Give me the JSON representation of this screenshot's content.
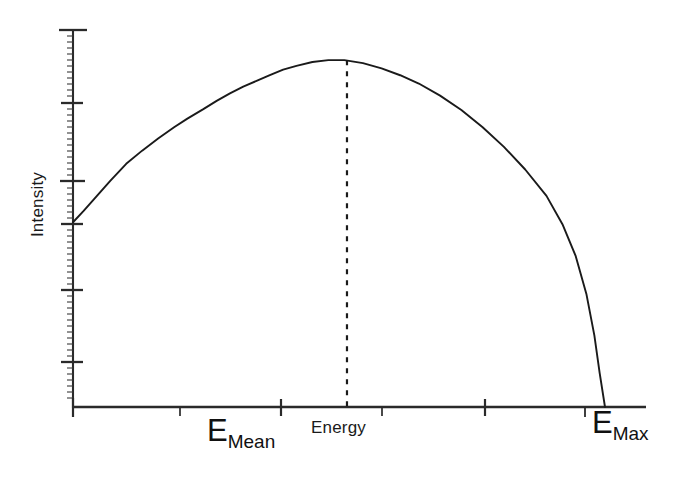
{
  "chart_data": {
    "type": "line",
    "title": "",
    "subtitle": "",
    "xlabel": "Energy",
    "ylabel": "Intensity",
    "grid": false,
    "legend": false,
    "legend_position": "none",
    "xlim": [
      0,
      1
    ],
    "ylim": [
      0,
      1
    ],
    "x_tick_labels": [
      "E_Mean",
      "Energy",
      "E_Max"
    ],
    "y_tick_labels": [],
    "series": [
      {
        "name": "Beta energy spectrum",
        "style": "solid",
        "color": "#1a1a1a",
        "x": [
          0.0,
          0.02,
          0.045,
          0.07,
          0.1,
          0.13,
          0.16,
          0.19,
          0.215,
          0.245,
          0.27,
          0.295,
          0.32,
          0.345,
          0.37,
          0.395,
          0.42,
          0.45,
          0.48,
          0.51,
          0.545,
          0.58,
          0.615,
          0.65,
          0.69,
          0.73,
          0.77,
          0.81,
          0.85,
          0.89,
          0.92,
          0.945,
          0.965,
          0.98,
          0.99,
          1.0
        ],
        "y": [
          0.49,
          0.52,
          0.56,
          0.6,
          0.645,
          0.68,
          0.712,
          0.742,
          0.765,
          0.79,
          0.812,
          0.832,
          0.85,
          0.865,
          0.88,
          0.895,
          0.905,
          0.915,
          0.92,
          0.92,
          0.912,
          0.898,
          0.88,
          0.858,
          0.826,
          0.788,
          0.742,
          0.69,
          0.63,
          0.56,
          0.485,
          0.4,
          0.3,
          0.19,
          0.09,
          0.0
        ]
      }
    ],
    "annotations": [
      {
        "name": "mean-energy-marker",
        "type": "vline",
        "style": "dashed",
        "x": 0.515,
        "y_from": 0.0,
        "y_to": 0.92,
        "label": "E_Mean"
      }
    ]
  },
  "axes": {
    "y_axis": {
      "name": "intensity-axis",
      "label": "Intensity",
      "major_tick_count": 6,
      "minor_ticks": true
    },
    "x_axis": {
      "name": "energy-axis",
      "label": "Energy",
      "major_tick_count": 6,
      "minor_ticks": false
    }
  },
  "labels": {
    "y_axis_title": "Intensity",
    "x_axis_title": "Energy",
    "e_mean": {
      "base": "E",
      "subscript": "Mean"
    },
    "e_max": {
      "base": "E",
      "subscript": "Max"
    }
  },
  "colors": {
    "background": "#ffffff",
    "axis": "#2a2a2a",
    "curve": "#1a1a1a",
    "dashed_marker": "#1a1a1a",
    "text": "#111111"
  }
}
